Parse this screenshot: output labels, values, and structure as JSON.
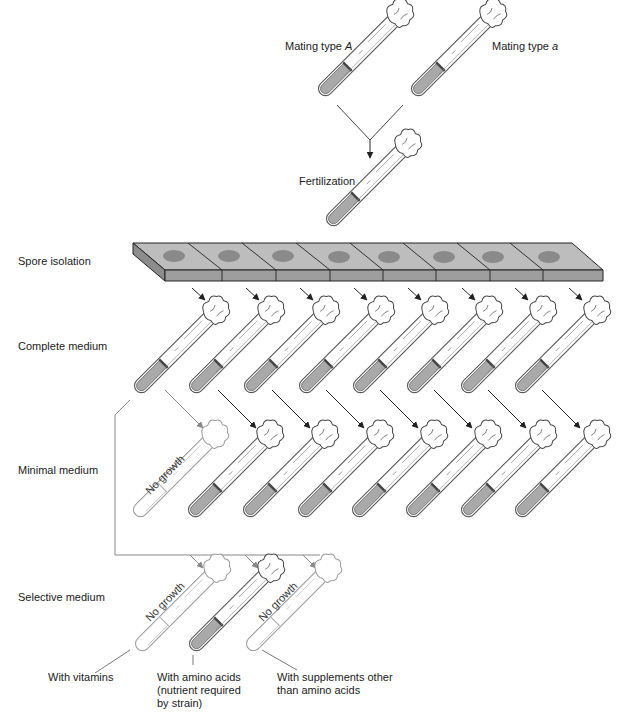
{
  "title_labels": {
    "mating_type_A": "Mating type A",
    "mating_type_A_prefix": "Mating type ",
    "mating_type_A_italic": "A",
    "mating_type_a_prefix": "Mating type ",
    "mating_type_a_italic": "a",
    "fertilization": "Fertilization"
  },
  "rows": {
    "spore_isolation": "Spore isolation",
    "complete_medium": "Complete medium",
    "minimal_medium": "Minimal medium",
    "selective_medium": "Selective medium"
  },
  "no_growth": "No growth",
  "selective_captions": {
    "vitamins": "With vitamins",
    "amino_line1": "With amino acids",
    "amino_line2": "(nutrient required",
    "amino_line3": "by strain)",
    "supplements_line1": "With supplements other",
    "supplements_line2": "than amino acids"
  },
  "spore_count": 8,
  "colors": {
    "tray_top": "#bdbdbd",
    "tray_front": "#9e9e9e",
    "tray_spore": "#8a8a8a",
    "medium": "#a9a9a9"
  }
}
